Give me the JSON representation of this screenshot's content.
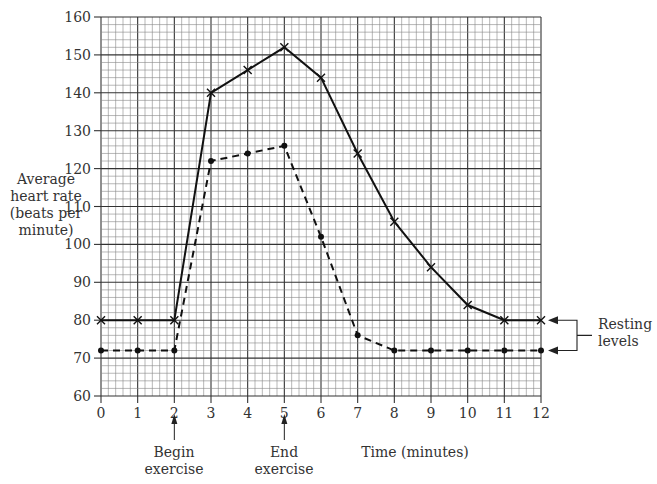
{
  "chart_data": {
    "type": "line",
    "title": "",
    "xlabel": "Time (minutes)",
    "ylabel": "Average heart rate (beats per minute)",
    "ylabel_lines": [
      "Average",
      "heart rate",
      "(beats per",
      "minute)"
    ],
    "x": [
      0,
      1,
      2,
      3,
      4,
      5,
      6,
      7,
      8,
      9,
      10,
      11,
      12
    ],
    "xlim": [
      0,
      12
    ],
    "ylim": [
      60,
      160
    ],
    "x_ticks": [
      0,
      1,
      2,
      3,
      4,
      5,
      6,
      7,
      8,
      9,
      10,
      11,
      12
    ],
    "y_ticks": [
      60,
      70,
      80,
      90,
      100,
      110,
      120,
      130,
      140,
      150,
      160
    ],
    "grid": true,
    "series": [
      {
        "name": "solid-cross",
        "style": "solid",
        "marker": "x",
        "values": [
          80,
          80,
          80,
          140,
          146,
          152,
          144,
          124,
          106,
          94,
          84,
          80,
          80
        ]
      },
      {
        "name": "dashed-dot",
        "style": "dashed",
        "marker": "dot",
        "values": [
          72,
          72,
          72,
          122,
          124,
          126,
          102,
          76,
          72,
          72,
          72,
          72,
          72
        ]
      }
    ],
    "annotations": [
      {
        "text_lines": [
          "Begin",
          "exercise"
        ],
        "x": 2
      },
      {
        "text_lines": [
          "End",
          "exercise"
        ],
        "x": 5
      },
      {
        "text_lines": [
          "Resting",
          "levels"
        ],
        "points_to": [
          80,
          72
        ]
      }
    ]
  },
  "labels": {
    "ylabel_1": "Average",
    "ylabel_2": "heart rate",
    "ylabel_3": "(beats per",
    "ylabel_4": "minute)",
    "xlabel": "Time (minutes)",
    "begin_1": "Begin",
    "begin_2": "exercise",
    "end_1": "End",
    "end_2": "exercise",
    "resting_1": "Resting",
    "resting_2": "levels"
  }
}
